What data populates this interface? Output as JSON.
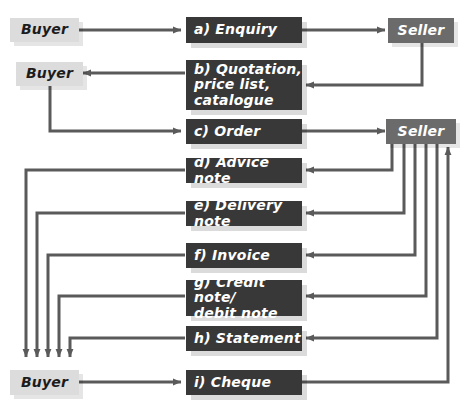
{
  "diagram": {
    "colors": {
      "background": "#ffffff",
      "buyer_box": "#dcdcdc",
      "seller_box": "#6b6b6b",
      "document_box": "#383838",
      "document_text": "#ffffff",
      "buyer_text": "#1c1c1c",
      "arrow": "#5a5a5a"
    },
    "parties": [
      {
        "id": "buyer-1",
        "label": "Buyer",
        "kind": "buyer"
      },
      {
        "id": "buyer-2",
        "label": "Buyer",
        "kind": "buyer"
      },
      {
        "id": "buyer-3",
        "label": "Buyer",
        "kind": "buyer"
      },
      {
        "id": "seller-1",
        "label": "Seller",
        "kind": "seller"
      },
      {
        "id": "seller-2",
        "label": "Seller",
        "kind": "seller"
      }
    ],
    "documents": [
      {
        "id": "doc-a",
        "label": "a) Enquiry",
        "step": "a",
        "name": "Enquiry",
        "direction": "buyer-to-seller"
      },
      {
        "id": "doc-b",
        "label": "b) Quotation,\nprice list,\ncatalogue",
        "step": "b",
        "name": "Quotation, price list, catalogue",
        "direction": "seller-to-buyer"
      },
      {
        "id": "doc-c",
        "label": "c) Order",
        "step": "c",
        "name": "Order",
        "direction": "buyer-to-seller"
      },
      {
        "id": "doc-d",
        "label": "d) Advice note",
        "step": "d",
        "name": "Advice note",
        "direction": "seller-to-buyer"
      },
      {
        "id": "doc-e",
        "label": "e) Delivery note",
        "step": "e",
        "name": "Delivery note",
        "direction": "seller-to-buyer"
      },
      {
        "id": "doc-f",
        "label": "f) Invoice",
        "step": "f",
        "name": "Invoice",
        "direction": "seller-to-buyer"
      },
      {
        "id": "doc-g",
        "label": "g) Credit note/\ndebit note",
        "step": "g",
        "name": "Credit note/debit note",
        "direction": "seller-to-buyer"
      },
      {
        "id": "doc-h",
        "label": "h) Statement",
        "step": "h",
        "name": "Statement",
        "direction": "seller-to-buyer"
      },
      {
        "id": "doc-i",
        "label": "i) Cheque",
        "step": "i",
        "name": "Cheque",
        "direction": "buyer-to-seller"
      }
    ]
  }
}
